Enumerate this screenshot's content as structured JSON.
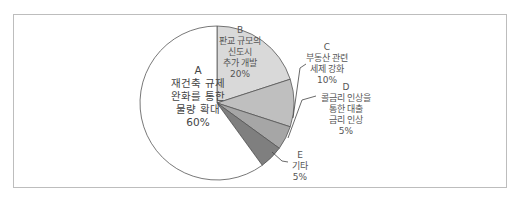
{
  "chart_data": {
    "type": "pie",
    "title": "",
    "slices": [
      {
        "key": "A",
        "label": "재건축 규제 완화를 통한 물량 확대",
        "lines": [
          "A",
          "재건축 규제",
          "완화를 통한",
          "물량 확대",
          "60%"
        ],
        "value": 60,
        "color": "#ffffff"
      },
      {
        "key": "B",
        "label": "판교 규모의 신도시 추가 개발",
        "lines": [
          "B",
          "판교 규모의",
          "신도시",
          "추가 개발",
          "20%"
        ],
        "value": 20,
        "color": "#d9d9d9"
      },
      {
        "key": "C",
        "label": "부동산 관련 세제 강화",
        "lines": [
          "C",
          "부동산 관련",
          "세제 강화",
          "10%"
        ],
        "value": 10,
        "color": "#bfbfbf"
      },
      {
        "key": "D",
        "label": "콜금리 인상을 통한 대출 금리 인상",
        "lines": [
          "D",
          "콜금리 인상을",
          "통한 대출",
          "금리 인상",
          "5%"
        ],
        "value": 5,
        "color": "#a6a6a6"
      },
      {
        "key": "E",
        "label": "기타",
        "lines": [
          "E",
          "기타",
          "5%"
        ],
        "value": 5,
        "color": "#7f7f7f"
      }
    ],
    "legend": "none",
    "units": "%"
  }
}
